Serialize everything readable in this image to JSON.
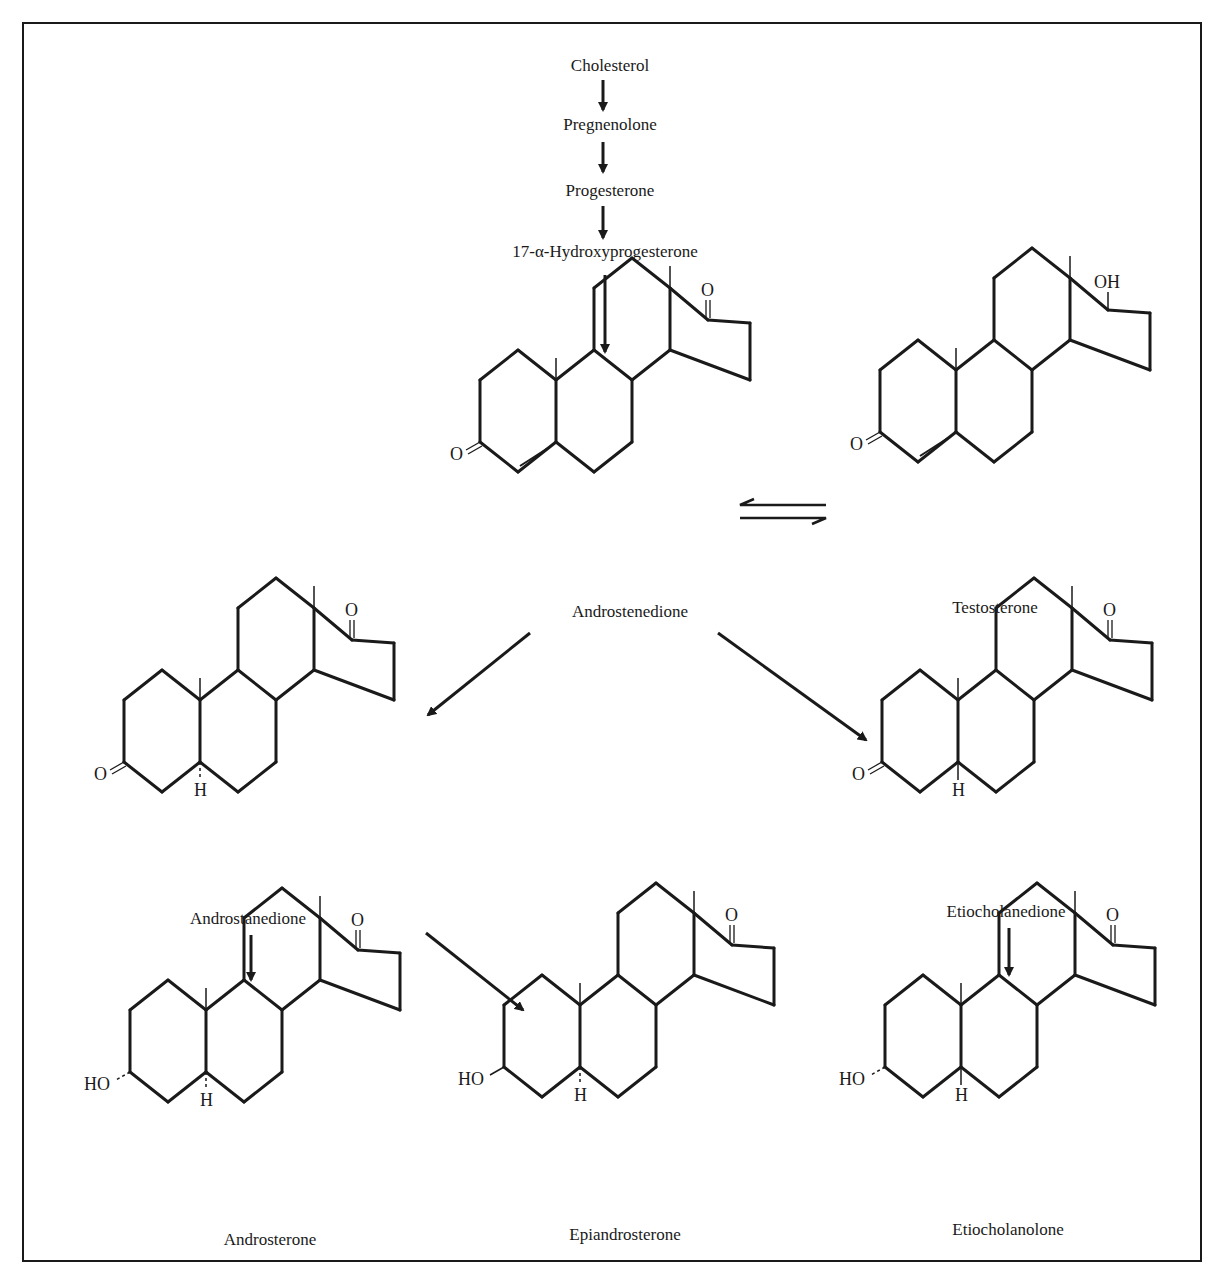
{
  "precursors": [
    {
      "label": "Cholesterol",
      "x": 610,
      "y": 68
    },
    {
      "label": "Pregnenolone",
      "x": 610,
      "y": 127
    },
    {
      "label": "Progesterone",
      "x": 610,
      "y": 193
    },
    {
      "label": "17-α-Hydroxyprogesterone",
      "x": 605,
      "y": 254
    }
  ],
  "compounds": [
    {
      "id": "androstenedione",
      "name": "Androstenedione",
      "nameX": 630,
      "nameY": 614,
      "ox": 480,
      "oy": 340,
      "c3": "ketone",
      "c17": "ketone",
      "delta4": true,
      "h5": "none"
    },
    {
      "id": "testosterone",
      "name": "Testosterone",
      "nameX": 995,
      "nameY": 610,
      "ox": 880,
      "oy": 330,
      "c3": "ketone",
      "c17": "hydroxyl",
      "delta4": true,
      "h5": "none"
    },
    {
      "id": "androstanedione",
      "name": "Androstanedione",
      "nameX": 248,
      "nameY": 921,
      "ox": 124,
      "oy": 660,
      "c3": "ketone",
      "c17": "ketone",
      "delta4": false,
      "h5": "alpha"
    },
    {
      "id": "etiocholanedione",
      "name": "Etiocholanedione",
      "nameX": 1006,
      "nameY": 914,
      "ox": 882,
      "oy": 660,
      "c3": "ketone",
      "c17": "ketone",
      "delta4": false,
      "h5": "beta"
    },
    {
      "id": "androsterone",
      "name": "Androsterone",
      "nameX": 270,
      "nameY": 1242,
      "ox": 130,
      "oy": 970,
      "c3": "hydroxyl-alpha",
      "c17": "ketone",
      "delta4": false,
      "h5": "alpha"
    },
    {
      "id": "epiandrosterone",
      "name": "Epiandrosterone",
      "nameX": 625,
      "nameY": 1237,
      "ox": 504,
      "oy": 965,
      "c3": "hydroxyl-beta",
      "c17": "ketone",
      "delta4": false,
      "h5": "alpha"
    },
    {
      "id": "etiocholanolone",
      "name": "Etiocholanolone",
      "nameX": 1008,
      "nameY": 1232,
      "ox": 885,
      "oy": 965,
      "c3": "hydroxyl-alpha",
      "c17": "ketone",
      "delta4": false,
      "h5": "beta"
    }
  ],
  "arrows": [
    {
      "from": "Cholesterol",
      "to": "Pregnenolone",
      "x1": 603,
      "y1": 80,
      "x2": 603,
      "y2": 110
    },
    {
      "from": "Pregnenolone",
      "to": "Progesterone",
      "x1": 603,
      "y1": 142,
      "x2": 603,
      "y2": 172
    },
    {
      "from": "Progesterone",
      "to": "17-α-Hydroxyprogesterone",
      "x1": 603,
      "y1": 206,
      "x2": 603,
      "y2": 238
    },
    {
      "from": "17-α-Hydroxyprogesterone",
      "to": "Androstenedione",
      "x1": 605,
      "y1": 275,
      "x2": 605,
      "y2": 352
    },
    {
      "from": "Androstenedione",
      "to": "Androstanedione",
      "x1": 530,
      "y1": 633,
      "x2": 428,
      "y2": 715
    },
    {
      "from": "Androstenedione",
      "to": "Etiocholanedione",
      "x1": 718,
      "y1": 633,
      "x2": 866,
      "y2": 740
    },
    {
      "from": "Androstanedione",
      "to": "Androsterone",
      "x1": 251,
      "y1": 935,
      "x2": 251,
      "y2": 980
    },
    {
      "from": "Androstanedione",
      "to": "Epiandrosterone",
      "x1": 426,
      "y1": 933,
      "x2": 523,
      "y2": 1010
    },
    {
      "from": "Etiocholanedione",
      "to": "Etiocholanolone",
      "x1": 1009,
      "y1": 928,
      "x2": 1009,
      "y2": 975
    }
  ],
  "equilibrium": {
    "between": [
      "Androstenedione",
      "Testosterone"
    ],
    "x1": 740,
    "x2": 826,
    "yTop": 505,
    "yBottom": 518
  },
  "atom_labels": {
    "oxygen": "O",
    "hydroxyl_right": "OH",
    "hydroxyl_left": "HO",
    "hydrogen": "H"
  },
  "colors": {
    "ink": "#1a1a1a",
    "background": "#ffffff"
  }
}
